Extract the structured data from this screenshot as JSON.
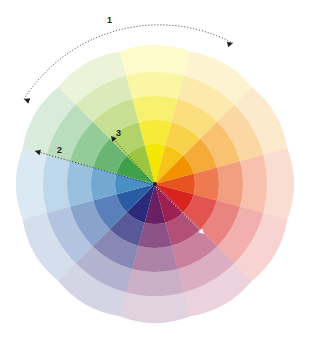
{
  "figure": {
    "type": "color-wheel-diagram",
    "background": "#ffffff",
    "center": {
      "x": 155,
      "y": 184
    },
    "outer_radius": 137,
    "sector_count": 12,
    "ring_count": 5,
    "petal_edge": true
  },
  "chart_data": {
    "type": "pie",
    "title": "",
    "subtitle": "",
    "xlabel": "",
    "ylabel": "",
    "legend_position": "none",
    "grid": false,
    "categories": [
      "yellow",
      "yellow-orange",
      "orange",
      "red-orange",
      "red",
      "magenta",
      "violet",
      "indigo",
      "blue",
      "cyan-blue",
      "green",
      "yellow-green"
    ],
    "values": [
      30,
      30,
      30,
      30,
      30,
      30,
      30,
      30,
      30,
      30,
      30,
      30
    ],
    "hue_angles_deg": [
      270,
      300,
      330,
      0,
      30,
      60,
      90,
      120,
      150,
      180,
      210,
      240
    ],
    "hues": [
      "#f3e600",
      "#f7c518",
      "#f39200",
      "#e8541f",
      "#d8241f",
      "#9e1f52",
      "#6b2064",
      "#2b2a7a",
      "#2a5ca6",
      "#4a8fc4",
      "#3fa24a",
      "#9cc63f"
    ],
    "ring_opacities": [
      1.0,
      0.78,
      0.56,
      0.36,
      0.2
    ],
    "ring_radii": [
      40,
      64,
      88,
      112,
      137
    ]
  },
  "annotations": {
    "items": [
      {
        "id": "annotation-1",
        "label": "1",
        "kind": "double-arrow-arc",
        "color": "#231f20",
        "style": "dotted",
        "describes": "hue span around the wheel rim",
        "label_x": 107,
        "label_y": 16,
        "start": {
          "x": 24,
          "y": 99
        },
        "end": {
          "x": 233,
          "y": 43
        }
      },
      {
        "id": "annotation-2",
        "label": "2",
        "kind": "arrow",
        "color": "#231f20",
        "style": "dotted",
        "describes": "radius from center outward to green sector",
        "label_x": 57,
        "label_y": 146,
        "start": {
          "x": 154,
          "y": 185
        },
        "end": {
          "x": 35,
          "y": 151
        }
      },
      {
        "id": "annotation-3",
        "label": "3",
        "kind": "arrow",
        "color": "#231f20",
        "style": "dotted",
        "describes": "radius from center outward to yellow sector",
        "label_x": 116,
        "label_y": 129,
        "start": {
          "x": 154,
          "y": 185
        },
        "end": {
          "x": 111,
          "y": 136
        }
      },
      {
        "id": "annotation-4",
        "label": "",
        "kind": "arrow",
        "color": "#ffffff",
        "style": "dotted",
        "describes": "radius from center outward into indigo sector",
        "start": {
          "x": 156,
          "y": 187
        },
        "end": {
          "x": 204,
          "y": 234
        }
      }
    ]
  }
}
